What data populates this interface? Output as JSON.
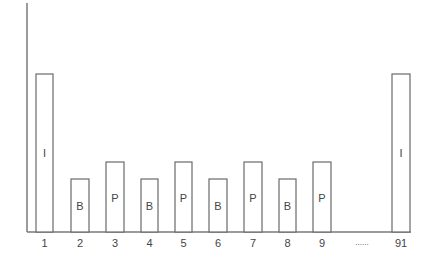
{
  "diagram": {
    "type": "frame-size-bar-diagram",
    "axis": {
      "has_y_axis": true,
      "has_x_axis": true
    },
    "bars": [
      {
        "index": "1",
        "label": "I",
        "kind": "I",
        "height": "tall"
      },
      {
        "index": "2",
        "label": "B",
        "kind": "B",
        "height": "short"
      },
      {
        "index": "3",
        "label": "P",
        "kind": "P",
        "height": "medium"
      },
      {
        "index": "4",
        "label": "B",
        "kind": "B",
        "height": "short"
      },
      {
        "index": "5",
        "label": "P",
        "kind": "P",
        "height": "medium"
      },
      {
        "index": "6",
        "label": "B",
        "kind": "B",
        "height": "short"
      },
      {
        "index": "7",
        "label": "P",
        "kind": "P",
        "height": "medium"
      },
      {
        "index": "8",
        "label": "B",
        "kind": "B",
        "height": "short"
      },
      {
        "index": "9",
        "label": "P",
        "kind": "P",
        "height": "medium"
      },
      {
        "index": "91",
        "label": "I",
        "kind": "I",
        "height": "tall"
      }
    ],
    "ellipsis": "......",
    "colors": {
      "stroke": "#6a6a6a",
      "axis": "#7a7a7a",
      "text": "#444444",
      "background": "#ffffff"
    }
  }
}
